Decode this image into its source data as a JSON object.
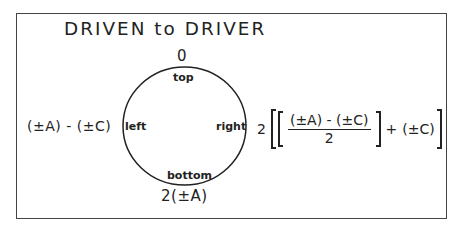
{
  "title": "DRIVEN to DRIVER",
  "circle": {
    "top_label": "top",
    "bottom_label": "bottom",
    "left_label": "left",
    "right_label": "right"
  },
  "values": {
    "top": "0",
    "bottom": "2(±A)",
    "left": "(±A) - (±C)"
  },
  "right_formula": {
    "coefficient": "2",
    "numerator": "(±A) - (±C)",
    "denominator": "2",
    "plus": "+",
    "addend": "(±C)"
  },
  "colors": {
    "line": "#222222",
    "frame": "#444444",
    "background": "#ffffff"
  }
}
